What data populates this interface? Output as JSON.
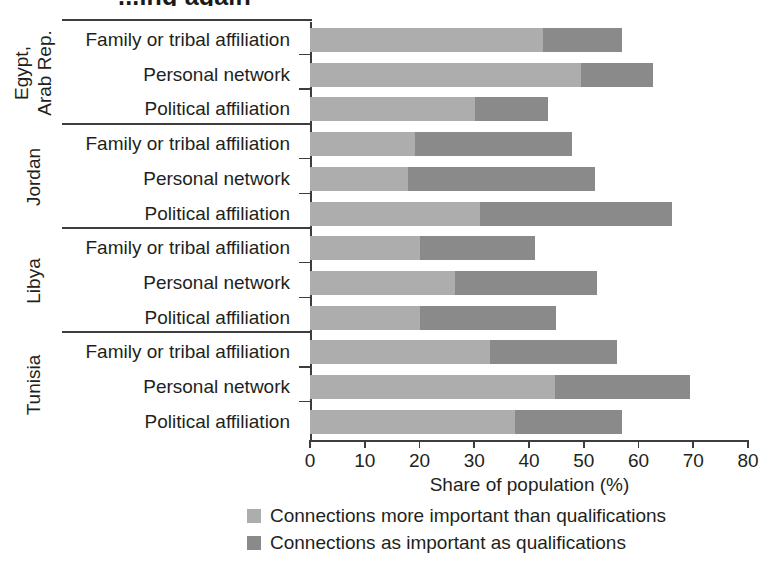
{
  "title": "...ing again",
  "chart_data": {
    "type": "bar",
    "orientation": "horizontal",
    "stacked": true,
    "title": "",
    "xlabel": "Share of population (%)",
    "ylabel": "",
    "xlim": [
      0,
      80
    ],
    "xticks": [
      0,
      10,
      20,
      30,
      40,
      50,
      60,
      70,
      80
    ],
    "xticklabels": [
      "0",
      "10",
      "20",
      "30",
      "40",
      "50",
      "60",
      "70",
      "80"
    ],
    "grid": false,
    "legend_position": "bottom",
    "series": [
      {
        "name": "Connections more important than qualifications",
        "color": "#adadad",
        "values": [
          42.6,
          49.5,
          30.1,
          19.2,
          17.9,
          31.0,
          20.1,
          26.5,
          20.1,
          32.9,
          44.7,
          37.4
        ]
      },
      {
        "name": "Connections as important as qualifications",
        "color": "#8a8a8a",
        "values": [
          14.4,
          13.1,
          13.4,
          28.7,
          34.2,
          35.1,
          21.0,
          25.9,
          24.8,
          23.2,
          24.7,
          19.6
        ]
      }
    ],
    "groups": [
      {
        "country": "Egypt, Arab Rep.",
        "country_lines": [
          "Egypt,",
          "Arab Rep."
        ],
        "rows": [
          {
            "label": "Family or tribal affiliation",
            "more_important": 42.6,
            "as_important": 14.4,
            "total": 57.0
          },
          {
            "label": "Personal network",
            "more_important": 49.5,
            "as_important": 13.1,
            "total": 62.6
          },
          {
            "label": "Political affiliation",
            "more_important": 30.1,
            "as_important": 13.4,
            "total": 43.5
          }
        ]
      },
      {
        "country": "Jordan",
        "country_lines": [
          "Jordan"
        ],
        "rows": [
          {
            "label": "Family or tribal affiliation",
            "more_important": 19.2,
            "as_important": 28.7,
            "total": 47.9
          },
          {
            "label": "Personal network",
            "more_important": 17.9,
            "as_important": 34.2,
            "total": 52.1
          },
          {
            "label": "Political affiliation",
            "more_important": 31.0,
            "as_important": 35.1,
            "total": 66.1
          }
        ]
      },
      {
        "country": "Libya",
        "country_lines": [
          "Libya"
        ],
        "rows": [
          {
            "label": "Family or tribal affiliation",
            "more_important": 20.1,
            "as_important": 21.0,
            "total": 41.1
          },
          {
            "label": "Personal network",
            "more_important": 26.5,
            "as_important": 25.9,
            "total": 52.4
          },
          {
            "label": "Political affiliation",
            "more_important": 20.1,
            "as_important": 24.8,
            "total": 44.9
          }
        ]
      },
      {
        "country": "Tunisia",
        "country_lines": [
          "Tunisia"
        ],
        "rows": [
          {
            "label": "Family or tribal affiliation",
            "more_important": 32.9,
            "as_important": 23.2,
            "total": 56.1
          },
          {
            "label": "Personal network",
            "more_important": 44.7,
            "as_important": 24.7,
            "total": 69.4
          },
          {
            "label": "Political affiliation",
            "more_important": 37.4,
            "as_important": 19.6,
            "total": 57.0
          }
        ]
      }
    ]
  },
  "legend": {
    "items": [
      {
        "label": "Connections more important than qualifications",
        "color": "#adadad"
      },
      {
        "label": "Connections as important as qualifications",
        "color": "#8a8a8a"
      }
    ]
  },
  "axis": {
    "x_title": "Share of population (%)"
  }
}
